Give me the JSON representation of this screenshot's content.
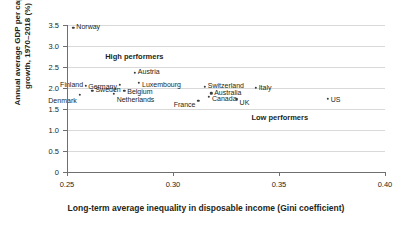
{
  "chart_data": {
    "type": "scatter",
    "title": "",
    "xlabel": "Long-term average inequality in disposable income (Gini coefficient)",
    "ylabel": "Annual average GDP per capita growth, 1970–2018 (%)",
    "xlim": [
      0.25,
      0.4
    ],
    "ylim": [
      0,
      3.5
    ],
    "xticks": [
      "0.25",
      "0.30",
      "0.35",
      "0.40"
    ],
    "xtick_values": [
      0.25,
      0.3,
      0.35,
      0.4
    ],
    "yticks": [
      "0",
      "0.5",
      "1.0",
      "1.5",
      "2.0",
      "2.5",
      "3.0",
      "3.5"
    ],
    "ytick_values": [
      0,
      0.5,
      1.0,
      1.5,
      2.0,
      2.5,
      3.0,
      3.5
    ],
    "grid": "horizontal",
    "legend": "none",
    "points": [
      {
        "name": "Norway",
        "x": 0.253,
        "y": 3.44
      },
      {
        "name": "Austria",
        "x": 0.282,
        "y": 2.36
      },
      {
        "name": "Luxembourg",
        "x": 0.284,
        "y": 2.13
      },
      {
        "name": "Germany",
        "x": 0.275,
        "y": 2.08
      },
      {
        "name": "Finland",
        "x": 0.259,
        "y": 2.05
      },
      {
        "name": "Switzerland",
        "x": 0.315,
        "y": 2.03
      },
      {
        "name": "Italy",
        "x": 0.339,
        "y": 2.0
      },
      {
        "name": "Sweden",
        "x": 0.262,
        "y": 1.94
      },
      {
        "name": "Belgium",
        "x": 0.277,
        "y": 1.93
      },
      {
        "name": "Netherlands",
        "x": 0.272,
        "y": 1.86
      },
      {
        "name": "Denmark",
        "x": 0.256,
        "y": 1.84
      },
      {
        "name": "Australia",
        "x": 0.318,
        "y": 1.87
      },
      {
        "name": "Canada",
        "x": 0.317,
        "y": 1.79
      },
      {
        "name": "UK",
        "x": 0.33,
        "y": 1.73
      },
      {
        "name": "US",
        "x": 0.373,
        "y": 1.74
      },
      {
        "name": "France",
        "x": 0.312,
        "y": 1.7
      }
    ],
    "annotations": [
      {
        "text": "High performers",
        "x": 0.268,
        "y": 2.76
      },
      {
        "text": "Low performers",
        "x": 0.337,
        "y": 1.3
      }
    ]
  },
  "colors": {
    "point": "#3c3c3c",
    "grid": "#d9d9d9",
    "axis": "#6f6f6f",
    "text": "#231f20",
    "background": "#ffffff"
  }
}
